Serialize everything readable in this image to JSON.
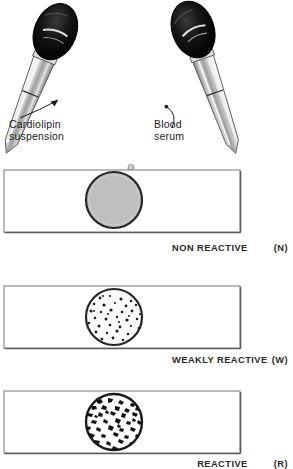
{
  "figure": {
    "reagent_label_left": {
      "line1": "Cardiolipin",
      "line2": "suspension"
    },
    "reagent_label_right": {
      "line1": "Blood",
      "line2": "serum"
    }
  },
  "colors": {
    "ink": "#1b1b1b",
    "bulb": "#0d0d0d",
    "glass_light": "#f2f2f2",
    "glass_shade": "#9a9a9a",
    "panel_border": "#8c8c8c",
    "panel_shadow": "#5a5a5a",
    "circle_ring": "#262626",
    "nonreactive_fill": "#bfbfbf",
    "panel_fill": "#ffffff"
  },
  "droppers": [
    {
      "name": "cardiolipin-dropper",
      "tilt": "leans-right",
      "bulb": "black-rubber-bulb"
    },
    {
      "name": "serum-dropper",
      "tilt": "leans-left",
      "bulb": "black-rubber-bulb"
    }
  ],
  "panels": [
    {
      "id": "non-reactive",
      "result_label": "NON REACTIVE",
      "result_code": "(N)",
      "spacer": "wide",
      "pattern": "uniform",
      "description": "even grey suspension, no clumping"
    },
    {
      "id": "weakly-reactive",
      "result_label": "WEAKLY  REACTIVE",
      "result_code": "(W)",
      "spacer": "thin",
      "pattern": "fine-dots",
      "description": "small fine clumps scattered on light field"
    },
    {
      "id": "reactive",
      "result_label": "REACTIVE",
      "result_code": "(R)",
      "spacer": "wide",
      "pattern": "coarse-clumps",
      "description": "large coarse flocculation clumps"
    }
  ]
}
